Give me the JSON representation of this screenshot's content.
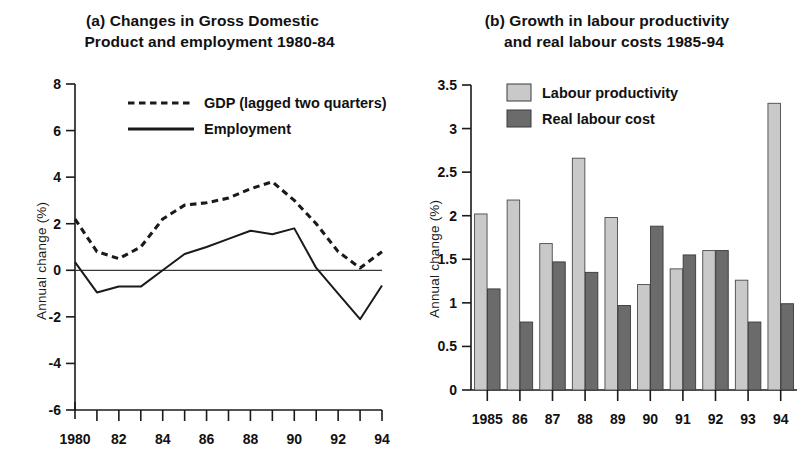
{
  "panels": {
    "a": {
      "title_line1": "(a) Changes in Gross Domestic",
      "title_line2": "Product and employment 1980-84",
      "ylabel": "Annual change (%)",
      "legend": [
        {
          "key": "gdp",
          "label": "GDP (lagged two quarters)",
          "style": "dashed"
        },
        {
          "key": "employment",
          "label": "Employment",
          "style": "solid"
        }
      ]
    },
    "b": {
      "title_line1": "(b) Growth in labour productivity",
      "title_line2": "and real labour costs 1985-94",
      "ylabel": "Annual change (%)",
      "legend": [
        {
          "key": "productivity",
          "label": "Labour productivity",
          "color": "#c9c9c9"
        },
        {
          "key": "cost",
          "label": "Real labour cost",
          "color": "#6b6b6b"
        }
      ]
    }
  },
  "chart_data": [
    {
      "id": "panel-a",
      "type": "line",
      "title": "(a) Changes in Gross Domestic Product and employment 1980-84",
      "xlabel": "",
      "ylabel": "Annual change (%)",
      "ylim": [
        -6,
        8
      ],
      "yticks": [
        8,
        6,
        4,
        2,
        0,
        -2,
        -4,
        -6
      ],
      "ytick_labels": [
        "8",
        "6",
        "4",
        "2",
        "0",
        "-2",
        "-4",
        "-6"
      ],
      "xlim": [
        1980,
        1994
      ],
      "xticks": [
        1980,
        1981,
        1982,
        1983,
        1984,
        1985,
        1986,
        1987,
        1988,
        1989,
        1990,
        1991,
        1992,
        1993,
        1994
      ],
      "xtick_labels": [
        "1980",
        "",
        "82",
        "",
        "84",
        "",
        "86",
        "",
        "88",
        "",
        "90",
        "",
        "92",
        "",
        "94"
      ],
      "grid": false,
      "zero_line": true,
      "legend_position": "top-center",
      "x": [
        1980,
        1981,
        1982,
        1983,
        1984,
        1985,
        1986,
        1987,
        1988,
        1989,
        1990,
        1991,
        1992,
        1993,
        1994
      ],
      "series": [
        {
          "name": "GDP (lagged two quarters)",
          "style": "dashed",
          "values": [
            2.2,
            0.8,
            0.5,
            1.0,
            2.2,
            2.8,
            2.9,
            3.1,
            3.5,
            3.8,
            3.0,
            2.0,
            0.8,
            0.1,
            0.8
          ]
        },
        {
          "name": "Employment",
          "style": "solid",
          "values": [
            0.35,
            -0.95,
            -0.7,
            -0.7,
            0.0,
            0.7,
            1.0,
            1.35,
            1.7,
            1.55,
            1.8,
            0.1,
            -1.0,
            -2.1,
            -0.65
          ]
        }
      ]
    },
    {
      "id": "panel-b",
      "type": "bar",
      "title": "(b) Growth in labour productivity and real labour costs 1985-94",
      "xlabel": "",
      "ylabel": "Annual change (%)",
      "ylim": [
        0,
        3.5
      ],
      "yticks": [
        0,
        0.5,
        1,
        1.5,
        2,
        2.5,
        3,
        3.5
      ],
      "ytick_labels": [
        "0",
        "0.5",
        "1",
        "1.5",
        "2",
        "2.5",
        "3",
        "3.5"
      ],
      "grid": false,
      "legend_position": "top-left",
      "categories": [
        "1985",
        "86",
        "87",
        "88",
        "89",
        "90",
        "91",
        "92",
        "93",
        "94"
      ],
      "series": [
        {
          "name": "Labour productivity",
          "color": "#c9c9c9",
          "values": [
            2.02,
            2.18,
            1.68,
            2.66,
            1.98,
            1.21,
            1.39,
            1.6,
            1.26,
            3.29
          ]
        },
        {
          "name": "Real labour cost",
          "color": "#6b6b6b",
          "values": [
            1.16,
            0.78,
            1.47,
            1.35,
            0.97,
            1.88,
            1.55,
            1.6,
            0.78,
            0.99
          ]
        }
      ]
    }
  ]
}
